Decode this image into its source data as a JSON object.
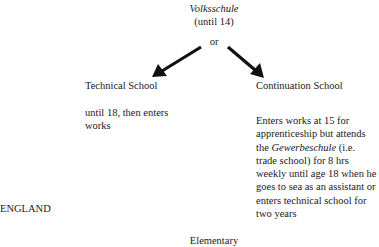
{
  "top": {
    "title": "Volksschule",
    "subtitle": "(until 14)",
    "connector": "or"
  },
  "left_branch": {
    "title": "Technical School",
    "description": "until 18, then enters works"
  },
  "right_branch": {
    "title": "Continuation School",
    "desc_part1": "Enters works at 15 for apprenticeship but attends the ",
    "desc_italic": "Gewerbeschule",
    "desc_part2": " (i.e. trade school) for 8 hrs",
    "desc_part3": "weekly until age 18 when he goes to sea as an assistant or enters technical school for two years"
  },
  "section_label": "ENGLAND",
  "bottom": {
    "title": "Elementary"
  },
  "colors": {
    "text": "#1a1a1a",
    "arrow": "#111111",
    "background": "#ffffff"
  }
}
